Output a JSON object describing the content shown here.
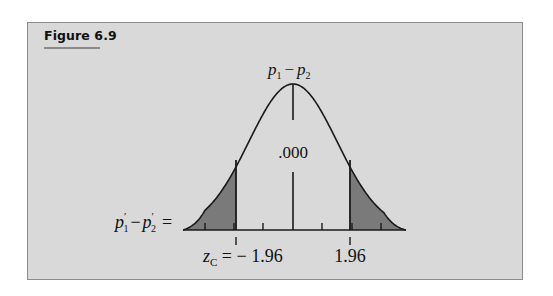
{
  "figure": {
    "title": "Figure 6.9",
    "top_label": {
      "p1": "p",
      "sub1": "1",
      "minus": "−",
      "p2": "p",
      "sub2": "2"
    },
    "center_value": ".000",
    "axis_label": {
      "p1": "p",
      "prime1": "′",
      "sub1": "1",
      "minus": "−",
      "p2": "p",
      "prime2": "′",
      "sub2": "2",
      "equals": "="
    },
    "z_left": {
      "z": "z",
      "sub": "C",
      "text": " = − 1.96"
    },
    "z_right": "1.96",
    "colors": {
      "panel": "#d9d9d9",
      "shade": "#7a7a7a",
      "line": "#1a1a1a"
    }
  },
  "chart_data": {
    "type": "area",
    "title": "Figure 6.9",
    "center_label": "p1 - p2",
    "center_value": 0.0,
    "critical_values": [
      -1.96,
      1.96
    ],
    "shaded_regions": [
      "z < -1.96",
      "z > 1.96"
    ],
    "xlabel": "p'1 - p'2",
    "z_label": "z_C",
    "ticks_z": [
      -3,
      -2,
      -1,
      0,
      1,
      2,
      3
    ]
  }
}
